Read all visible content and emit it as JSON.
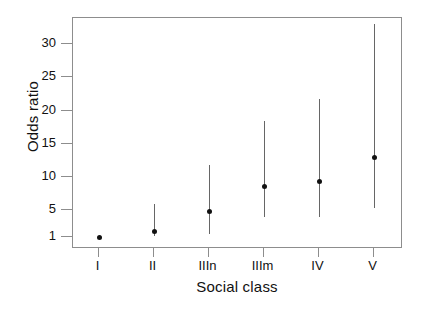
{
  "chart_data": {
    "type": "scatter",
    "title": "",
    "xlabel": "Social class",
    "ylabel": "Odds ratio",
    "categories": [
      "I",
      "II",
      "IIIn",
      "IIIm",
      "IV",
      "V"
    ],
    "yticks": [
      1,
      5,
      10,
      15,
      20,
      25,
      30
    ],
    "ytick_labels": [
      "1",
      "5",
      "10",
      "15",
      "20",
      "25",
      "30"
    ],
    "ylim": [
      0,
      33
    ],
    "grid": false,
    "legend": null,
    "series": [
      {
        "name": "Odds ratio (point estimate)",
        "values": [
          1.0,
          1.9,
          4.9,
          8.7,
          9.4,
          13.0
        ]
      },
      {
        "name": "95% confidence interval lower",
        "values": [
          1.0,
          1.1,
          1.4,
          4.0,
          4.0,
          5.3
        ]
      },
      {
        "name": "95% confidence interval upper",
        "values": [
          1.0,
          5.9,
          11.8,
          18.5,
          21.8,
          33.0
        ]
      }
    ],
    "points": [
      {
        "category": "I",
        "estimate": 1.0,
        "ci_low": 1.0,
        "ci_high": 1.0,
        "reference": true
      },
      {
        "category": "II",
        "estimate": 1.9,
        "ci_low": 1.1,
        "ci_high": 5.9,
        "reference": false
      },
      {
        "category": "IIIn",
        "estimate": 4.9,
        "ci_low": 1.4,
        "ci_high": 11.8,
        "reference": false
      },
      {
        "category": "IIIm",
        "estimate": 8.7,
        "ci_low": 4.0,
        "ci_high": 18.5,
        "reference": false
      },
      {
        "category": "IV",
        "estimate": 9.4,
        "ci_low": 4.0,
        "ci_high": 21.8,
        "reference": false
      },
      {
        "category": "V",
        "estimate": 13.0,
        "ci_low": 5.3,
        "ci_high": 33.0,
        "reference": false
      }
    ],
    "marker_color": "#111111",
    "ci_color": "#666666",
    "axis_color": "#8d8d8d",
    "background": "#ffffff"
  }
}
